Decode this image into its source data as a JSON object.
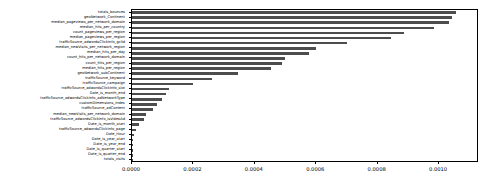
{
  "chart_data": {
    "type": "bar",
    "orientation": "horizontal",
    "title": "",
    "xlabel": "",
    "ylabel": "",
    "xlim": [
      0.0,
      0.00113
    ],
    "xticks": [
      "0.0000",
      "0.0002",
      "0.0004",
      "0.0006",
      "0.0008",
      "0.0010"
    ],
    "xtick_values": [
      0.0,
      0.0002,
      0.0004,
      0.0006,
      0.0008,
      0.001
    ],
    "grid": false,
    "legend": "none",
    "bar_color": "#4d4d4d",
    "categories": [
      "totals_bounces",
      "geoNetwork_Continent",
      "median_pageviews_per_network_domain",
      "median_hits_per_country",
      "count_pageviews_per_region",
      "median_pageviews_per_region",
      "trafficSource_adwordsClickInfo_gclId",
      "median_newVisits_per_network_region",
      "median_hits_per_day",
      "count_hits_per_network_domain",
      "count_hits_per_region",
      "median_hits_per_region",
      "geoNetwork_subContinent",
      "trafficSource_keyword",
      "trafficSource_campaign",
      "trafficSource_adwordsClickInfo_slot",
      "Date_is_month_end",
      "trafficSource_adwordsClickInfo_adNetworkType",
      "customDimensions_index",
      "trafficSource_adContent",
      "median_newVisits_per_network_domain",
      "trafficSource_adwordsClickInfo_isVideoAd",
      "Date_is_month_start",
      "trafficSource_adwordsClickInfo_page",
      "Date_Hour",
      "Date_is_year_start",
      "Date_is_year_end",
      "Date_is_quarter_start",
      "Date_is_quarter_end",
      "totals_visits"
    ],
    "values": [
      0.001055,
      0.001042,
      0.001032,
      0.000985,
      0.000885,
      0.000845,
      0.0007,
      0.0006,
      0.000575,
      0.000497,
      0.00049,
      0.000452,
      0.000345,
      0.000262,
      0.0002,
      0.000122,
      0.00011,
      9.8e-05,
      8e-05,
      7e-05,
      4.6e-05,
      3.8e-05,
      2.2e-05,
      1.4e-05,
      7e-06,
      4e-06,
      3e-06,
      2e-06,
      2e-06,
      1e-06
    ]
  }
}
